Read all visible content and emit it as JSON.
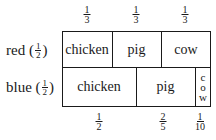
{
  "rows": [
    {
      "label": "red",
      "fraction": {
        "num": "1",
        "den": "2"
      },
      "cells": [
        {
          "text": "chicken",
          "fraction": {
            "num": "1",
            "den": "3"
          }
        },
        {
          "text": "pig",
          "fraction": {
            "num": "1",
            "den": "3"
          }
        },
        {
          "text": "cow",
          "fraction": {
            "num": "1",
            "den": "3"
          }
        }
      ]
    },
    {
      "label": "blue",
      "fraction": {
        "num": "1",
        "den": "2"
      },
      "cells": [
        {
          "text": "chicken",
          "fraction": {
            "num": "1",
            "den": "2"
          }
        },
        {
          "text": "pig",
          "fraction": {
            "num": "2",
            "den": "5"
          }
        },
        {
          "text": "cow",
          "vertical_letters": [
            "c",
            "o",
            "w"
          ],
          "fraction": {
            "num": "1",
            "den": "10"
          }
        }
      ]
    }
  ],
  "colors": {
    "ink": "#1a1a1a",
    "background": "#ffffff"
  }
}
